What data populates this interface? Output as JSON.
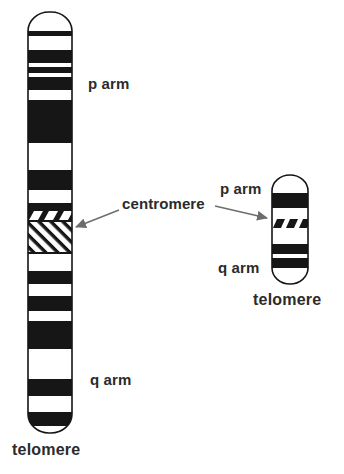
{
  "palette": {
    "ink": "#161616",
    "paper": "#ffffff",
    "text": "#2b2b2b",
    "arrow": "#6d6d6d"
  },
  "labels": {
    "large_p_arm": "p arm",
    "large_q_arm": "q arm",
    "large_telomere": "telomere",
    "centromere": "centromere",
    "small_p_arm": "p arm",
    "small_q_arm": "q arm",
    "small_telomere": "telomere"
  },
  "large_chromosome": {
    "name": "extended chromosome with G-bands",
    "x": 28,
    "y": 12,
    "width": 44,
    "height": 421,
    "cap_rx": 21,
    "cap_ry": 19,
    "bands": [
      {
        "y": 31,
        "h": 5,
        "style": "solid"
      },
      {
        "y": 50,
        "h": 13,
        "style": "solid"
      },
      {
        "y": 67,
        "h": 6,
        "style": "solid"
      },
      {
        "y": 77,
        "h": 13,
        "style": "solid"
      },
      {
        "y": 100,
        "h": 43,
        "style": "solid"
      },
      {
        "y": 170,
        "h": 20,
        "style": "solid"
      },
      {
        "y": 203,
        "h": 6,
        "style": "solid"
      },
      {
        "y": 209,
        "h": 13,
        "style": "white_dashes_on_black"
      },
      {
        "y": 222,
        "h": 32,
        "style": "hatch"
      },
      {
        "y": 271,
        "h": 13,
        "style": "solid"
      },
      {
        "y": 296,
        "h": 15,
        "style": "solid"
      },
      {
        "y": 321,
        "h": 28,
        "style": "solid"
      },
      {
        "y": 379,
        "h": 17,
        "style": "solid"
      },
      {
        "y": 412,
        "h": 14,
        "style": "solid"
      }
    ]
  },
  "small_chromosome": {
    "name": "condensed chromosome",
    "x": 272,
    "y": 175,
    "width": 36,
    "height": 109,
    "cap_rx": 18,
    "cap_ry": 16,
    "bands": [
      {
        "y": 193,
        "h": 15,
        "style": "solid"
      },
      {
        "y": 218,
        "h": 11,
        "style": "black_dashes_on_white"
      },
      {
        "y": 244,
        "h": 10,
        "style": "solid"
      },
      {
        "y": 258,
        "h": 10,
        "style": "solid"
      }
    ]
  },
  "arrows": [
    {
      "x1": 119,
      "y1": 210,
      "x2": 76,
      "y2": 227
    },
    {
      "x1": 215,
      "y1": 206,
      "x2": 267,
      "y2": 218
    }
  ]
}
